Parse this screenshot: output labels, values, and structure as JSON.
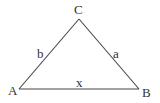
{
  "diagram": {
    "type": "triangle",
    "vertices": [
      {
        "id": "A",
        "label": "A"
      },
      {
        "id": "B",
        "label": "B"
      },
      {
        "id": "C",
        "label": "C"
      }
    ],
    "sides": [
      {
        "from": "A",
        "to": "C",
        "label": "b"
      },
      {
        "from": "C",
        "to": "B",
        "label": "a"
      },
      {
        "from": "A",
        "to": "B",
        "label": "x"
      }
    ],
    "colors": {
      "stroke": "#444444",
      "text": "#333333",
      "background": "#ffffff"
    }
  }
}
